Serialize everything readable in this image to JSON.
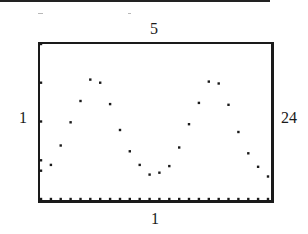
{
  "window": {
    "ymax_label": "5",
    "ymin_label": "1",
    "xmin_label": "1",
    "xmax_label": "24"
  },
  "colors": {
    "ink": "#1a1a1a",
    "background": "#ffffff"
  },
  "chart_data": {
    "type": "scatter",
    "title": "",
    "xlabel": "",
    "ylabel": "",
    "xlim": [
      1,
      24
    ],
    "ylim": [
      1,
      5
    ],
    "grid": false,
    "y_ticks": [
      2,
      3,
      4,
      5
    ],
    "x_ticks": [
      1,
      2,
      3,
      4,
      5,
      6,
      7,
      8,
      9,
      10,
      11,
      12,
      13,
      14,
      15,
      16,
      17,
      18,
      19,
      20,
      21,
      22,
      23,
      24
    ],
    "x": [
      1,
      2,
      3,
      4,
      5,
      6,
      7,
      8,
      9,
      10,
      11,
      12,
      13,
      14,
      15,
      16,
      17,
      18,
      19,
      20,
      21,
      22,
      23,
      24
    ],
    "y": [
      1.73,
      1.88,
      2.38,
      2.98,
      3.53,
      4.08,
      4.0,
      3.45,
      2.78,
      2.23,
      1.88,
      1.63,
      1.68,
      1.85,
      2.33,
      2.93,
      3.48,
      4.03,
      3.98,
      3.43,
      2.73,
      2.18,
      1.83,
      1.58
    ]
  }
}
